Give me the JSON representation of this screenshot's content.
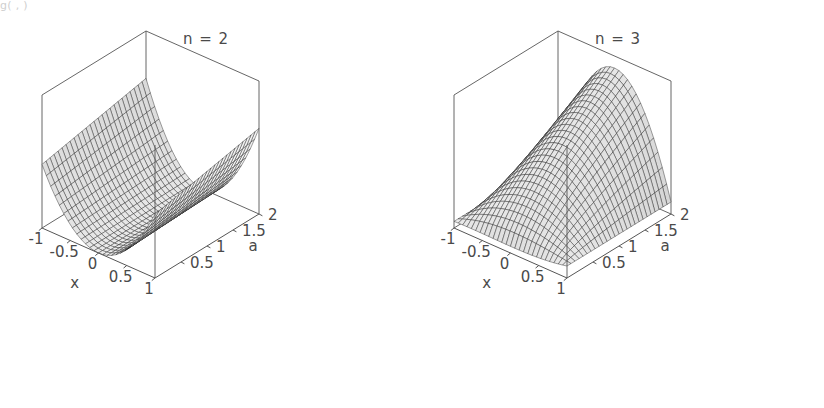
{
  "figure": {
    "caption_fragment": "g(     ,    )",
    "background": "#ffffff",
    "width": 824,
    "height": 408
  },
  "chart_data": [
    {
      "type": "surface",
      "panel": "left",
      "title": "n = 2",
      "xlabel": "x",
      "ylabel": "a",
      "zlabel": "",
      "xlim": [
        -1,
        1
      ],
      "ylim": [
        0,
        2
      ],
      "xticks": [
        "-1",
        "-0.5",
        "0",
        "0.5",
        "1"
      ],
      "xtick_values": [
        -1,
        -0.5,
        0,
        0.5,
        1
      ],
      "yticks": [
        "0.5",
        "1",
        "1.5",
        "2"
      ],
      "ytick_values": [
        0.5,
        1,
        1.5,
        2
      ],
      "n": 2,
      "grid": true,
      "mesh_rows": 26,
      "mesh_cols": 26,
      "surface_shade": "grayscale-lambert",
      "description": "Parabolic valley surface, minimum along x = 0, rising toward x = -1 and x = +1, nearly independent of a.",
      "z_expression": "|x|^n * (a/2)",
      "zlim": [
        0,
        1
      ],
      "sample_z": {
        "x": [
          -1,
          -0.5,
          0,
          0.5,
          1
        ],
        "a": [
          0,
          0.5,
          1,
          1.5,
          2
        ],
        "values": [
          [
            0.0,
            0.25,
            0.5,
            0.75,
            1.0
          ],
          [
            0.0,
            0.0625,
            0.125,
            0.1875,
            0.25
          ],
          [
            0.0,
            0.0,
            0.0,
            0.0,
            0.0
          ],
          [
            0.0,
            0.0625,
            0.125,
            0.1875,
            0.25
          ],
          [
            0.0,
            0.25,
            0.5,
            0.75,
            1.0
          ]
        ]
      }
    },
    {
      "type": "surface",
      "panel": "right",
      "title": "n = 3",
      "xlabel": "x",
      "ylabel": "a",
      "zlabel": "",
      "xlim": [
        -1,
        1
      ],
      "ylim": [
        0,
        2
      ],
      "xticks": [
        "-1",
        "-0.5",
        "0",
        "0.5",
        "1"
      ],
      "xtick_values": [
        -1,
        -0.5,
        0,
        0.5,
        1
      ],
      "yticks": [
        "0.5",
        "1",
        "1.5",
        "2"
      ],
      "ytick_values": [
        0.5,
        1,
        1.5,
        2
      ],
      "n": 3,
      "grid": true,
      "mesh_rows": 26,
      "mesh_cols": 26,
      "surface_shade": "grayscale-lambert",
      "description": "Dome / saddle-like surface, rising from a deep dip near x = -1 to a broad crest across the middle and falling toward the right edge.",
      "z_expression": "(1 - x^2) * (a/2) + 0.15",
      "zlim": [
        0,
        1
      ],
      "sample_z": {
        "x": [
          -1,
          -0.5,
          0,
          0.5,
          1
        ],
        "a": [
          0,
          0.5,
          1,
          1.5,
          2
        ],
        "values": [
          [
            0.15,
            0.15,
            0.15,
            0.15,
            0.15
          ],
          [
            0.15,
            0.34,
            0.525,
            0.71,
            0.9
          ],
          [
            0.15,
            0.4,
            0.65,
            0.9,
            1.0
          ],
          [
            0.15,
            0.34,
            0.525,
            0.71,
            0.9
          ],
          [
            0.15,
            0.15,
            0.15,
            0.15,
            0.15
          ]
        ]
      }
    }
  ]
}
